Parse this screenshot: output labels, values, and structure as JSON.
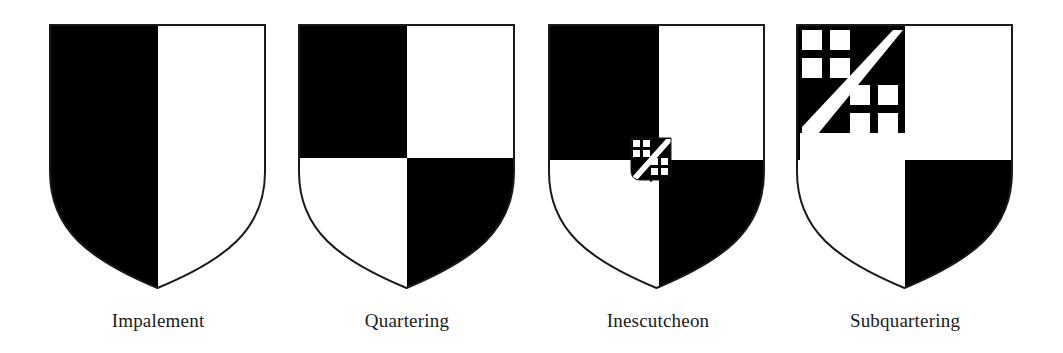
{
  "figure": {
    "colors": {
      "tincture_dark": "#000000",
      "tincture_light": "#ffffff",
      "outline": "#1a1a1a"
    },
    "shields": [
      {
        "id": "impalement",
        "label": "Impalement",
        "description": "Shield divided vertically: left half black, right half white"
      },
      {
        "id": "quartering",
        "label": "Quartering",
        "description": "Shield divided into four quarters: black, white / white, black"
      },
      {
        "id": "inescutcheon",
        "label": "Inescutcheon",
        "description": "Quartered shield with a small escutcheon at center bearing checks and a bend"
      },
      {
        "id": "subquartering",
        "label": "Subquartering",
        "description": "Quartered shield whose first quarter is itself subdivided with checks and a bend"
      }
    ]
  }
}
